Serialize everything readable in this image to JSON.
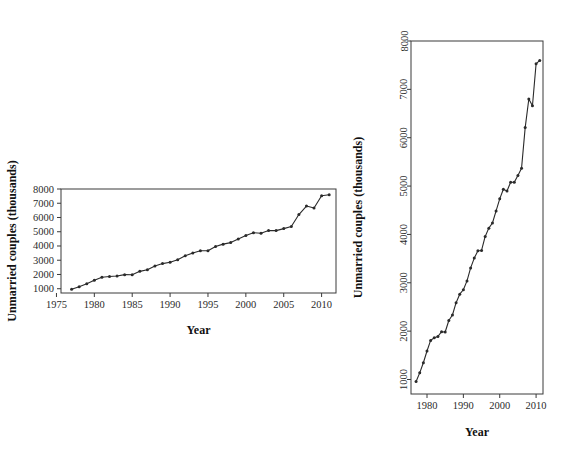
{
  "figure": {
    "panel_count": 2,
    "background_color": "#ffffff",
    "line_color": "#2a2a2a",
    "axis_color": "#3a3a3a"
  },
  "chart_data": [
    {
      "panel": "left",
      "type": "line",
      "title": "",
      "xlabel": "Year",
      "ylabel": "Unmarried couples (thousands)",
      "xlim": [
        1975.6,
        2011.9
      ],
      "ylim": [
        700,
        8000
      ],
      "xticks": [
        1975,
        1980,
        1985,
        1990,
        1995,
        2000,
        2005,
        2010
      ],
      "xticklabels": [
        "1975",
        "1980",
        "1985",
        "1990",
        "1995",
        "2000",
        "2005",
        "2010"
      ],
      "yticks": [
        1000,
        2000,
        3000,
        4000,
        5000,
        6000,
        7000,
        8000
      ],
      "yticklabels": [
        "1000",
        "2000",
        "3000",
        "4000",
        "5000",
        "6000",
        "7000",
        "8000"
      ],
      "ytick_rotation": 0,
      "grid": false,
      "legend": "none",
      "markers": true,
      "x": [
        1977,
        1978,
        1979,
        1980,
        1981,
        1982,
        1983,
        1984,
        1985,
        1986,
        1987,
        1988,
        1989,
        1990,
        1991,
        1992,
        1993,
        1994,
        1995,
        1996,
        1997,
        1998,
        1999,
        2000,
        2001,
        2002,
        2003,
        2004,
        2005,
        2006,
        2007,
        2008,
        2009,
        2010,
        2011
      ],
      "y": [
        957,
        1137,
        1346,
        1589,
        1808,
        1863,
        1891,
        1988,
        1983,
        2220,
        2334,
        2588,
        2764,
        2856,
        3039,
        3308,
        3510,
        3661,
        3668,
        3958,
        4130,
        4236,
        4486,
        4736,
        4934,
        4898,
        5080,
        5080,
        5220,
        5368,
        6209,
        6801,
        6661,
        7529,
        7599
      ]
    },
    {
      "panel": "right",
      "type": "line",
      "title": "",
      "xlabel": "Year",
      "ylabel": "Unmarried couples (thousands)",
      "xlim": [
        1975.6,
        2011.9
      ],
      "ylim": [
        700,
        8000
      ],
      "xticks": [
        1980,
        1990,
        2000,
        2010
      ],
      "xticklabels": [
        "1980",
        "1990",
        "2000",
        "2010"
      ],
      "yticks": [
        1000,
        2000,
        3000,
        4000,
        5000,
        6000,
        7000,
        8000
      ],
      "yticklabels": [
        "1000",
        "2000",
        "3000",
        "4000",
        "5000",
        "6000",
        "7000",
        "8000"
      ],
      "ytick_rotation": 90,
      "grid": false,
      "legend": "none",
      "markers": true,
      "x": [
        1977,
        1978,
        1979,
        1980,
        1981,
        1982,
        1983,
        1984,
        1985,
        1986,
        1987,
        1988,
        1989,
        1990,
        1991,
        1992,
        1993,
        1994,
        1995,
        1996,
        1997,
        1998,
        1999,
        2000,
        2001,
        2002,
        2003,
        2004,
        2005,
        2006,
        2007,
        2008,
        2009,
        2010,
        2011
      ],
      "y": [
        957,
        1137,
        1346,
        1589,
        1808,
        1863,
        1891,
        1988,
        1983,
        2220,
        2334,
        2588,
        2764,
        2856,
        3039,
        3308,
        3510,
        3661,
        3668,
        3958,
        4130,
        4236,
        4486,
        4736,
        4934,
        4898,
        5080,
        5080,
        5220,
        5368,
        6209,
        6801,
        6661,
        7529,
        7599
      ]
    }
  ]
}
